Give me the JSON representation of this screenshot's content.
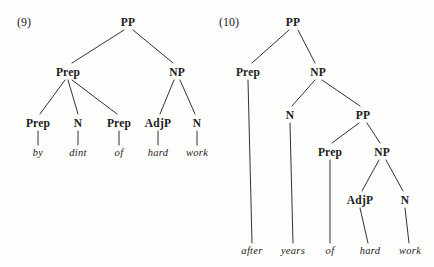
{
  "page": {
    "background_color": "#fdfdfc",
    "ink_color": "#1b1b1b",
    "width": 434,
    "height": 267
  },
  "examples": [
    {
      "number_label": "(9)",
      "number_x": 24,
      "number_y": 22,
      "sentence": "by dint of hard work",
      "nodes": [
        {
          "label": "PP",
          "x": 128,
          "y": 22
        },
        {
          "label": "Prep",
          "x": 68,
          "y": 72
        },
        {
          "label": "NP",
          "x": 177,
          "y": 72
        },
        {
          "label": "Prep",
          "x": 38,
          "y": 123
        },
        {
          "label": "N",
          "x": 78,
          "y": 123
        },
        {
          "label": "Prep",
          "x": 119,
          "y": 123
        },
        {
          "label": "AdjP",
          "x": 158,
          "y": 123
        },
        {
          "label": "N",
          "x": 197,
          "y": 123
        }
      ],
      "terminals": [
        {
          "word": "by",
          "x": 38,
          "y": 152
        },
        {
          "word": "dint",
          "x": 78,
          "y": 152
        },
        {
          "word": "of",
          "x": 119,
          "y": 152
        },
        {
          "word": "hard",
          "x": 158,
          "y": 152
        },
        {
          "word": "work",
          "x": 197,
          "y": 152
        }
      ],
      "edges": [
        {
          "x1": 124,
          "y1": 30,
          "x2": 72,
          "y2": 63
        },
        {
          "x1": 133,
          "y1": 30,
          "x2": 173,
          "y2": 63
        },
        {
          "x1": 65,
          "y1": 80,
          "x2": 40,
          "y2": 114
        },
        {
          "x1": 68,
          "y1": 80,
          "x2": 78,
          "y2": 114
        },
        {
          "x1": 72,
          "y1": 80,
          "x2": 117,
          "y2": 114
        },
        {
          "x1": 174,
          "y1": 80,
          "x2": 160,
          "y2": 114
        },
        {
          "x1": 180,
          "y1": 80,
          "x2": 195,
          "y2": 114
        },
        {
          "x1": 38,
          "y1": 131,
          "x2": 38,
          "y2": 145
        },
        {
          "x1": 78,
          "y1": 131,
          "x2": 78,
          "y2": 145
        },
        {
          "x1": 119,
          "y1": 131,
          "x2": 119,
          "y2": 145
        },
        {
          "x1": 158,
          "y1": 131,
          "x2": 158,
          "y2": 145
        },
        {
          "x1": 197,
          "y1": 131,
          "x2": 197,
          "y2": 145
        }
      ]
    },
    {
      "number_label": "(10)",
      "number_x": 229,
      "number_y": 22,
      "sentence": "after years of hard work",
      "nodes": [
        {
          "label": "PP",
          "x": 293,
          "y": 22
        },
        {
          "label": "Prep",
          "x": 248,
          "y": 72
        },
        {
          "label": "NP",
          "x": 318,
          "y": 72
        },
        {
          "label": "N",
          "x": 290,
          "y": 115
        },
        {
          "label": "PP",
          "x": 363,
          "y": 115
        },
        {
          "label": "Prep",
          "x": 330,
          "y": 152
        },
        {
          "label": "NP",
          "x": 382,
          "y": 152
        },
        {
          "label": "AdjP",
          "x": 360,
          "y": 200
        },
        {
          "label": "N",
          "x": 405,
          "y": 200
        }
      ],
      "terminals": [
        {
          "word": "after",
          "x": 252,
          "y": 250
        },
        {
          "word": "years",
          "x": 293,
          "y": 250
        },
        {
          "word": "of",
          "x": 330,
          "y": 250
        },
        {
          "word": "hard",
          "x": 370,
          "y": 250
        },
        {
          "word": "work",
          "x": 410,
          "y": 250
        }
      ],
      "edges": [
        {
          "x1": 289,
          "y1": 30,
          "x2": 252,
          "y2": 63
        },
        {
          "x1": 298,
          "y1": 30,
          "x2": 315,
          "y2": 63
        },
        {
          "x1": 315,
          "y1": 80,
          "x2": 292,
          "y2": 106
        },
        {
          "x1": 322,
          "y1": 80,
          "x2": 360,
          "y2": 106
        },
        {
          "x1": 359,
          "y1": 123,
          "x2": 332,
          "y2": 143
        },
        {
          "x1": 367,
          "y1": 123,
          "x2": 380,
          "y2": 143
        },
        {
          "x1": 379,
          "y1": 160,
          "x2": 362,
          "y2": 191
        },
        {
          "x1": 386,
          "y1": 160,
          "x2": 403,
          "y2": 191
        },
        {
          "x1": 248,
          "y1": 80,
          "x2": 252,
          "y2": 243
        },
        {
          "x1": 290,
          "y1": 123,
          "x2": 293,
          "y2": 243
        },
        {
          "x1": 330,
          "y1": 160,
          "x2": 330,
          "y2": 243
        },
        {
          "x1": 360,
          "y1": 208,
          "x2": 368,
          "y2": 243
        },
        {
          "x1": 405,
          "y1": 208,
          "x2": 409,
          "y2": 243
        }
      ]
    }
  ]
}
